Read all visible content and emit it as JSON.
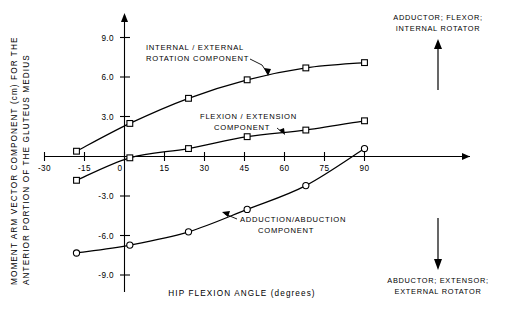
{
  "chart_data": {
    "type": "line",
    "title": "",
    "xlabel": "HIP FLEXION ANGLE (degrees)",
    "ylabel": "MOMENT ARM VECTOR COMPONENT (cm) FOR THE ANTERIOR PORTION OF THE GLUTEUS MEDIUS",
    "ylabel_line1": "MOMENT ARM VECTOR COMPONENT (cm) FOR THE",
    "ylabel_line2": "ANTERIOR PORTION OF THE GLUTEUS MEDIUS",
    "xlim": [
      -36,
      102
    ],
    "ylim": [
      -10.5,
      10.5
    ],
    "xticks": [
      -30,
      -15,
      0,
      15,
      30,
      45,
      60,
      75,
      90
    ],
    "xticklabels": [
      "-30",
      "-15",
      "0",
      "15",
      "30",
      "45",
      "60",
      "75",
      "90"
    ],
    "yticks": [
      9.0,
      6.0,
      3.0,
      -3.0,
      -6.0,
      -9.0
    ],
    "yticklabels": [
      "9.0",
      "6.0",
      "3.0",
      "-3.0",
      "-6.0",
      "-9.0"
    ],
    "grid": false,
    "legend_position": "inline-annotations",
    "series": [
      {
        "name": "INTERNAL / EXTERNAL ROTATION COMPONENT",
        "marker": "square",
        "x": [
          -18,
          2,
          24,
          46,
          68,
          90
        ],
        "values": [
          0.4,
          2.5,
          4.4,
          5.8,
          6.7,
          7.1
        ]
      },
      {
        "name": "FLEXION / EXTENSION COMPONENT",
        "marker": "square",
        "x": [
          -18,
          2,
          24,
          46,
          68,
          90
        ],
        "values": [
          -1.8,
          -0.1,
          0.6,
          1.5,
          2.0,
          2.7
        ]
      },
      {
        "name": "ADDUCTION / ABDUCTION COMPONENT",
        "marker": "circle",
        "x": [
          -18,
          2,
          24,
          46,
          68,
          90
        ],
        "values": [
          -7.3,
          -6.7,
          -5.7,
          -4.0,
          -2.2,
          0.6
        ]
      }
    ],
    "annotations": [
      {
        "id": "rotation",
        "line1": "INTERNAL / EXTERNAL",
        "line2": "ROTATION COMPONENT"
      },
      {
        "id": "flexion",
        "line1": "FLEXION / EXTENSION",
        "line2": "COMPONENT"
      },
      {
        "id": "adduction",
        "line1": "ADDUCTION/ABDUCTION",
        "line2": "COMPONENT"
      }
    ],
    "direction_labels": {
      "up_line1": "ADDUCTOR; FLEXOR;",
      "up_line2": "INTERNAL ROTATOR",
      "down_line1": "ABDUCTOR; EXTENSOR;",
      "down_line2": "EXTERNAL ROTATOR"
    }
  }
}
